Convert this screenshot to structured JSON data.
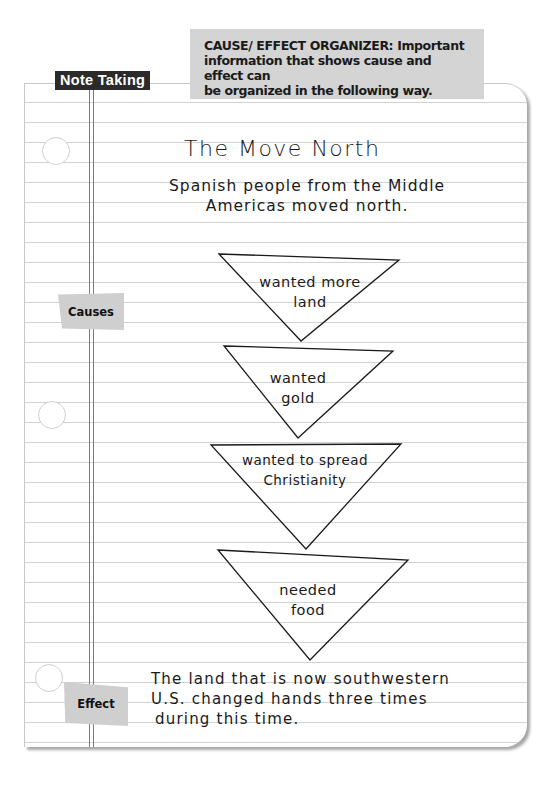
{
  "header": {
    "label": "Note Taking",
    "organizer_line1": "CAUSE/ EFFECT ORGANIZER:  Important",
    "organizer_line2": "information that shows cause and effect can",
    "organizer_line3": "be organized in the following way."
  },
  "notes": {
    "title": "The Move North",
    "intro_line1": "Spanish people from the Middle",
    "intro_line2": "Americas moved north."
  },
  "side_labels": {
    "causes": "Causes",
    "effect": "Effect"
  },
  "causes": [
    {
      "line1": "wanted more",
      "line2": "land"
    },
    {
      "line1": "wanted",
      "line2": "gold"
    },
    {
      "line1": "wanted to spread",
      "line2": "Christianity"
    },
    {
      "line1": "needed",
      "line2": "food"
    }
  ],
  "effect": {
    "line1": "The land that is now southwestern",
    "line2": "U.S. changed hands three times",
    "line3": "during this time."
  }
}
